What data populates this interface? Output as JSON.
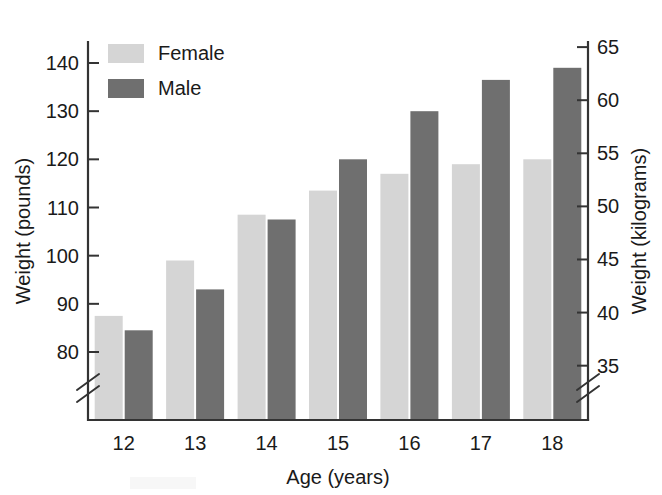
{
  "chart_data": {
    "type": "bar",
    "title": "",
    "subtitle": "",
    "xlabel": "Age (years)",
    "ylabel": "Weight (pounds)",
    "y2label": "Weight (kilograms)",
    "categories": [
      "12",
      "13",
      "14",
      "15",
      "16",
      "17",
      "18"
    ],
    "series": [
      {
        "name": "Female",
        "color": "#d5d5d5",
        "values": [
          87.5,
          99.0,
          108.5,
          113.5,
          117.0,
          119.0,
          120.0
        ]
      },
      {
        "name": "Male",
        "color": "#6f6f6f",
        "values": [
          84.5,
          93.0,
          107.5,
          120.0,
          130.0,
          136.5,
          139.0
        ]
      }
    ],
    "ylim": [
      80,
      140
    ],
    "yticks": [
      "80",
      "90",
      "100",
      "110",
      "120",
      "130",
      "140"
    ],
    "ytick_values": [
      80,
      90,
      100,
      110,
      120,
      130,
      140
    ],
    "y2lim": [
      36.29,
      63.5
    ],
    "y2ticks": [
      "35",
      "40",
      "45",
      "50",
      "55",
      "60",
      "65"
    ],
    "y2tick_values": [
      35,
      40,
      45,
      50,
      55,
      60,
      65
    ],
    "grid": false,
    "axis_break": true,
    "axis_break_note": "double-slash break mark on both vertical axes below the lowest tick",
    "legend": {
      "position": "top-left-inside",
      "entries": [
        {
          "label": "Female",
          "color": "#d5d5d5"
        },
        {
          "label": "Male",
          "color": "#6f6f6f"
        }
      ]
    }
  },
  "axes": {
    "left_title": "Weight (pounds)",
    "right_title": "Weight (kilograms)",
    "bottom_title": "Age (years)"
  },
  "artifact": {
    "name": "partial-legend-swatch",
    "color": "#d5d5d5"
  }
}
